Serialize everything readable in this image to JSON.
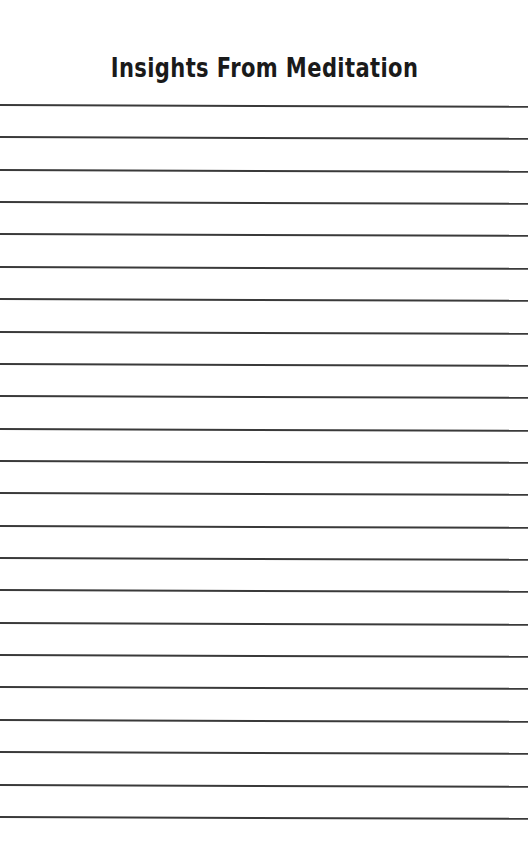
{
  "page": {
    "title": "Insights From Meditation",
    "line_count": 23,
    "first_line_y": 104,
    "line_spacing": 32.36,
    "line_color": "#3a3a3a",
    "background": "#ffffff"
  }
}
